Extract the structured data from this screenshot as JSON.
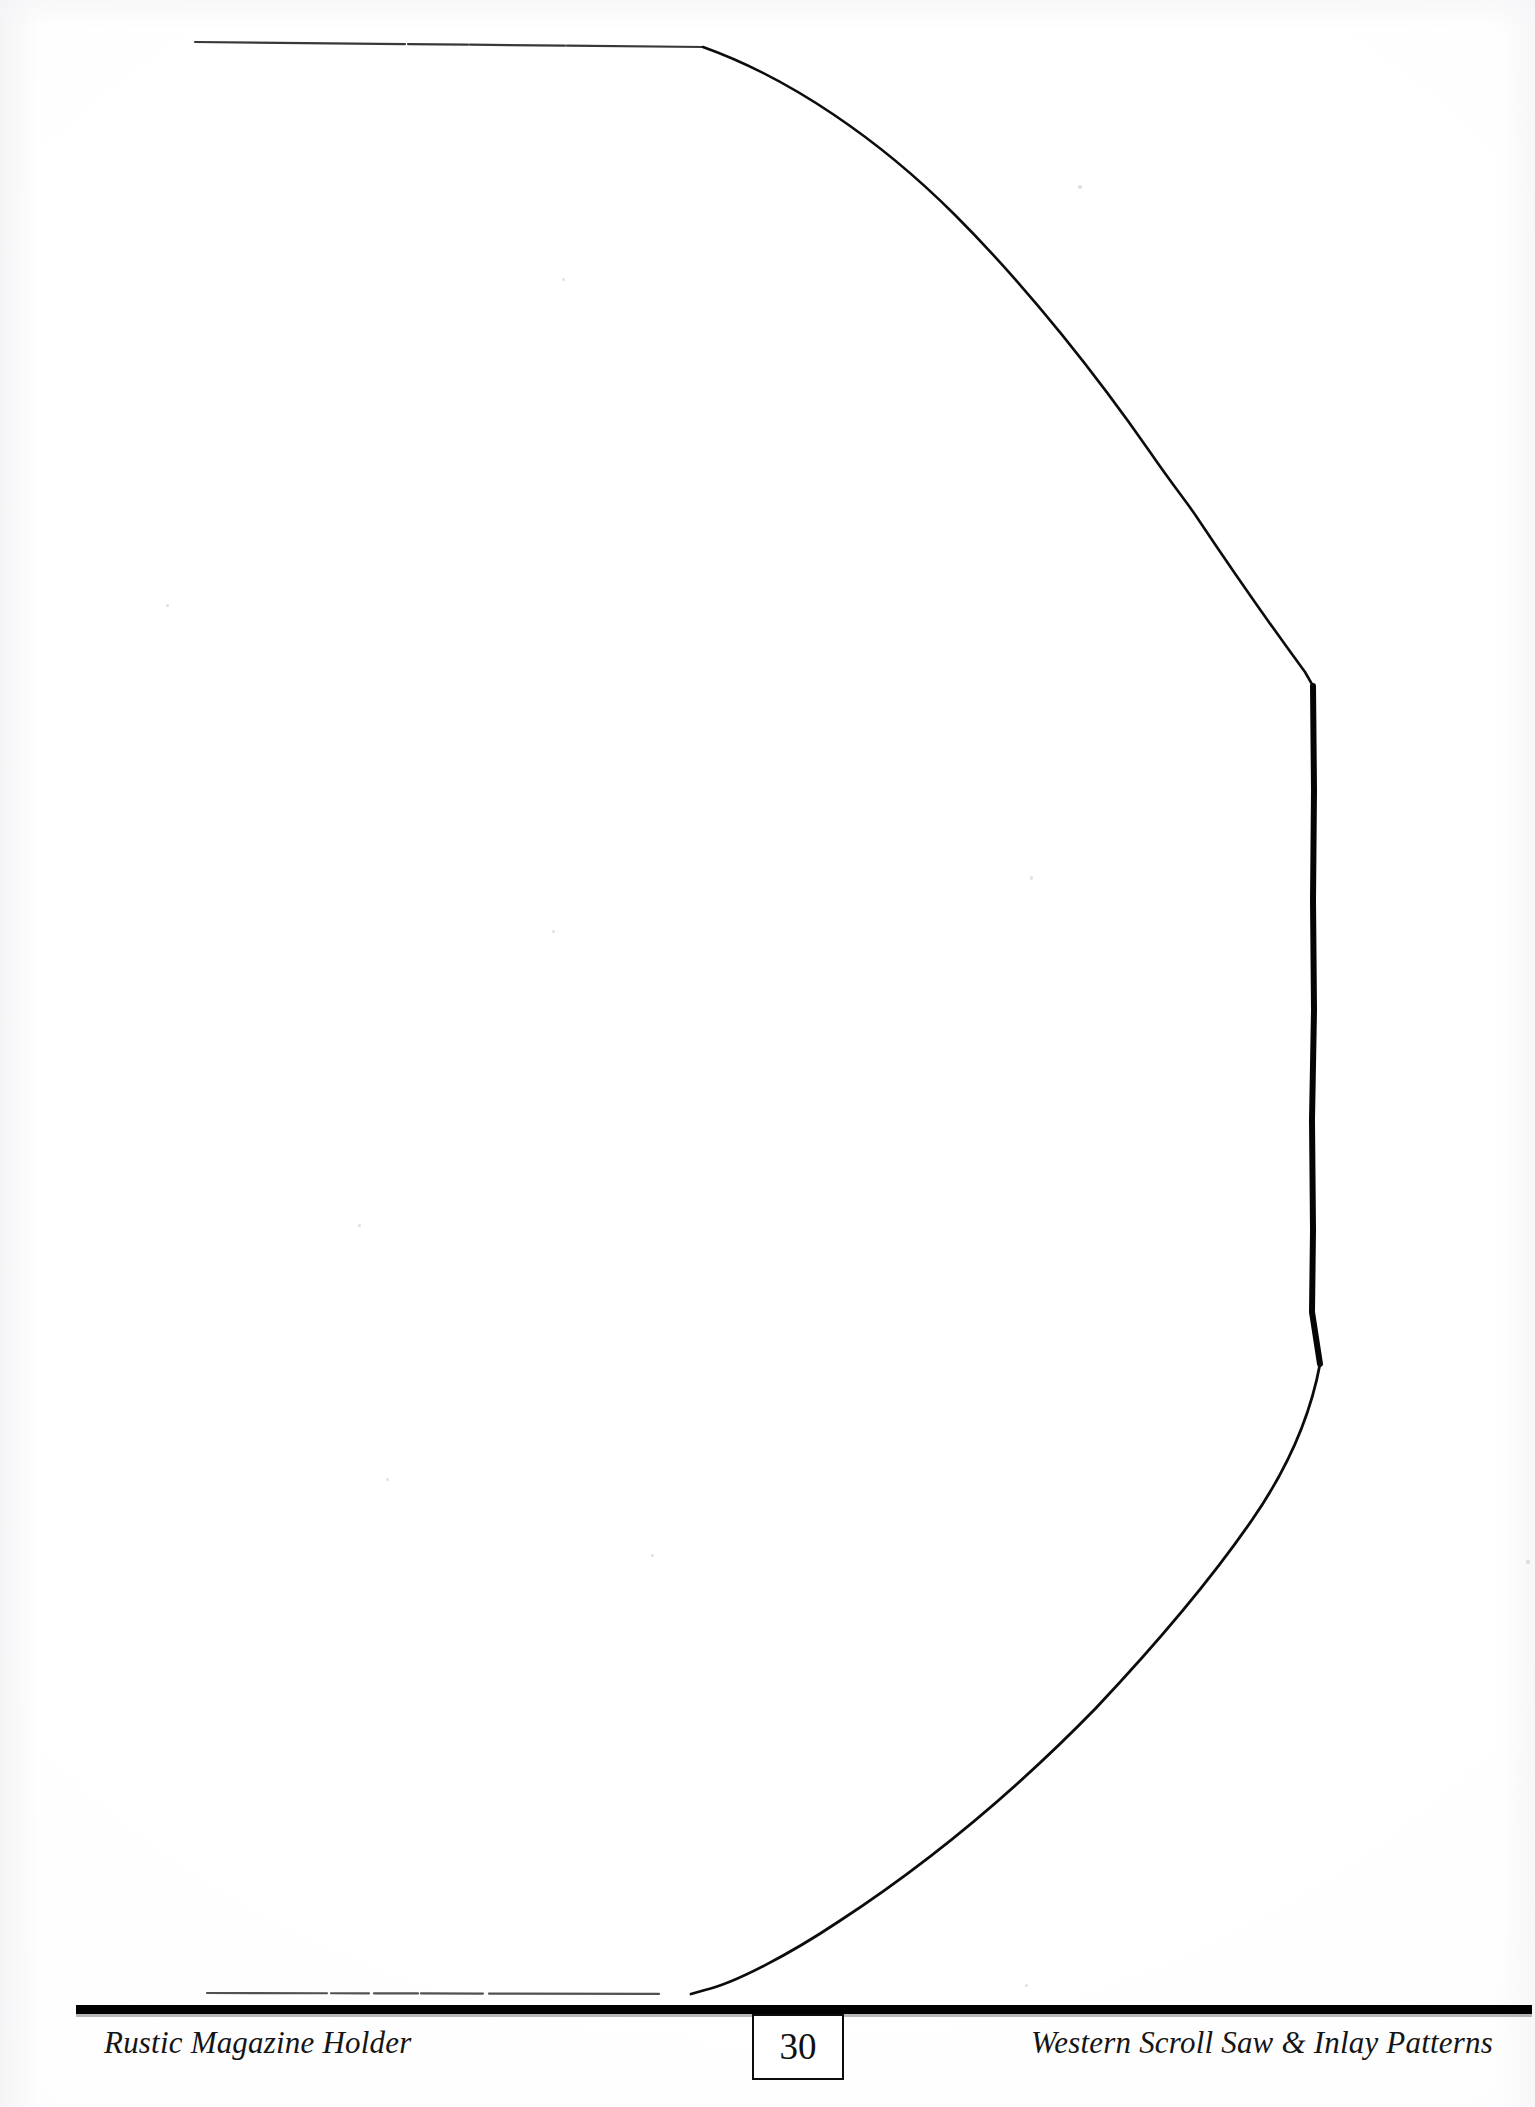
{
  "page": {
    "width": 1535,
    "height": 2107,
    "background_color": "#fefefe",
    "ink_color": "#000000",
    "kind": "scanned-book-page"
  },
  "footer": {
    "left_caption": "Rustic Magazine Holder",
    "page_number": "30",
    "right_caption": "Western Scroll Saw & Inlay Patterns",
    "rule_color": "#000000"
  },
  "pattern": {
    "name": "rustic-magazine-holder-side-profile",
    "description": "Half pattern outline for the side panel of a rustic magazine holder",
    "stroke_color": "#0a0a0a",
    "top_edge": {
      "start": [
        195,
        42
      ],
      "end": [
        703,
        47
      ],
      "style": "faint-broken"
    },
    "bottom_edge": {
      "start": [
        207,
        1993
      ],
      "end": [
        691,
        1994
      ],
      "style": "faint-broken"
    },
    "upper_arc_points": [
      [
        703,
        47
      ],
      [
        800,
        95
      ],
      [
        880,
        150
      ],
      [
        950,
        210
      ],
      [
        1020,
        282
      ],
      [
        1080,
        356
      ],
      [
        1130,
        425
      ],
      [
        1170,
        480
      ],
      [
        1196,
        516
      ]
    ],
    "upper_vertical_points": [
      [
        1196,
        516
      ],
      [
        1260,
        610
      ],
      [
        1305,
        672
      ],
      [
        1313,
        686
      ]
    ],
    "spine_points": [
      [
        1313,
        686
      ],
      [
        1314,
        800
      ],
      [
        1313,
        950
      ],
      [
        1312,
        1100
      ],
      [
        1313,
        1250
      ],
      [
        1312,
        1330
      ],
      [
        1320,
        1364
      ]
    ],
    "lower_arc_points": [
      [
        1320,
        1364
      ],
      [
        1300,
        1430
      ],
      [
        1270,
        1490
      ],
      [
        1230,
        1552
      ],
      [
        1175,
        1625
      ],
      [
        1110,
        1700
      ],
      [
        1030,
        1780
      ],
      [
        935,
        1855
      ],
      [
        840,
        1920
      ],
      [
        760,
        1965
      ],
      [
        705,
        1988
      ],
      [
        691,
        1994
      ]
    ]
  }
}
